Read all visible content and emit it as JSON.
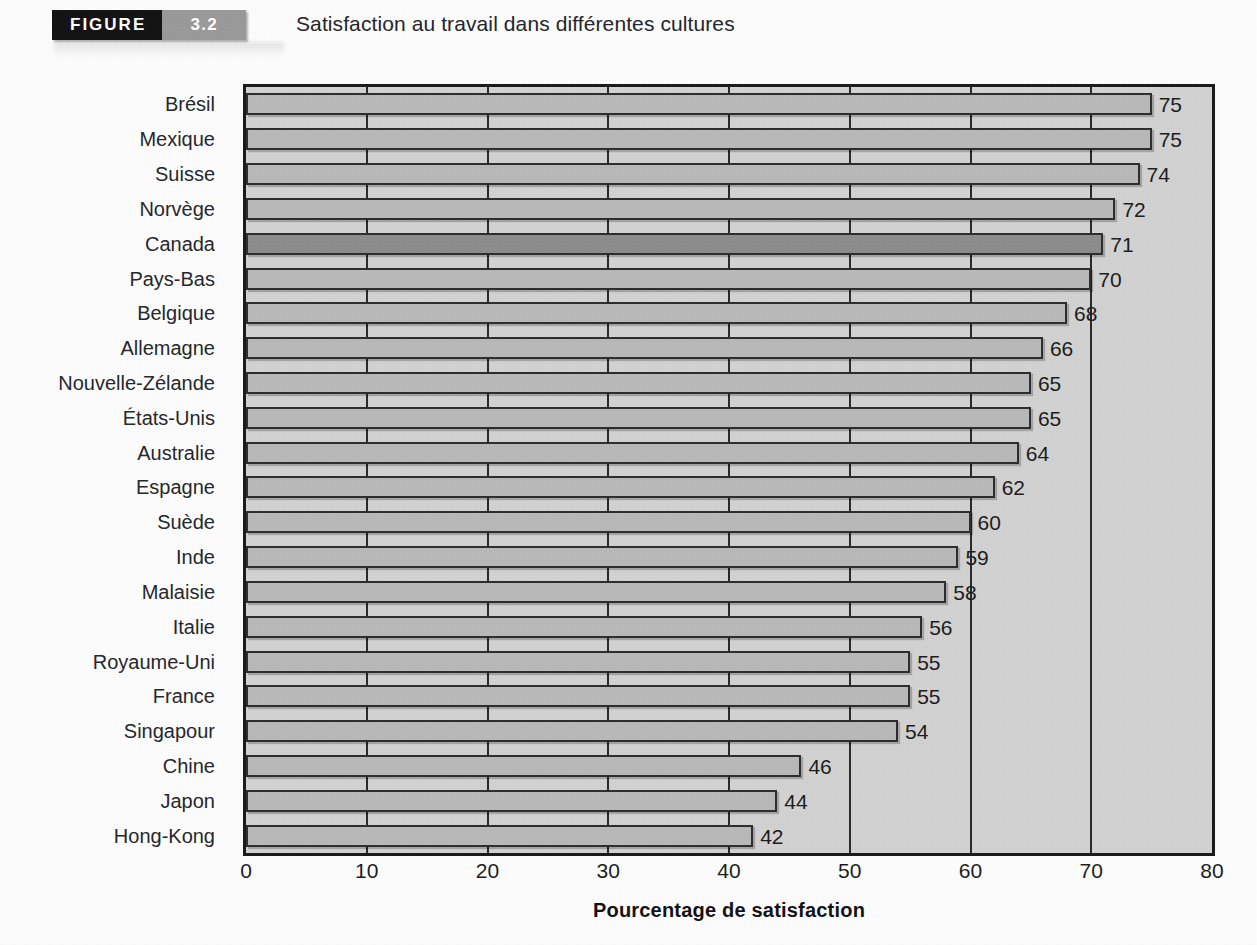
{
  "header": {
    "figure_word": "FIGURE",
    "figure_number": "3.2",
    "title": "Satisfaction au travail dans différentes cultures"
  },
  "chart_data": {
    "type": "bar",
    "orientation": "horizontal",
    "title": "Satisfaction au travail dans différentes cultures",
    "xlabel": "Pourcentage de satisfaction",
    "ylabel": "",
    "xlim": [
      0,
      80
    ],
    "xticks": [
      0,
      10,
      20,
      30,
      40,
      50,
      60,
      70,
      80
    ],
    "grid": true,
    "legend": "none",
    "highlight_category": "Canada",
    "categories": [
      "Brésil",
      "Mexique",
      "Suisse",
      "Norvège",
      "Canada",
      "Pays-Bas",
      "Belgique",
      "Allemagne",
      "Nouvelle-Zélande",
      "États-Unis",
      "Australie",
      "Espagne",
      "Suède",
      "Inde",
      "Malaisie",
      "Italie",
      "Royaume-Uni",
      "France",
      "Singapour",
      "Chine",
      "Japon",
      "Hong-Kong"
    ],
    "values": [
      75,
      75,
      74,
      72,
      71,
      70,
      68,
      66,
      65,
      65,
      64,
      62,
      60,
      59,
      58,
      56,
      55,
      55,
      54,
      46,
      44,
      42
    ],
    "value_labels": [
      "75",
      "75",
      "74",
      "72",
      "71",
      "70",
      "68",
      "66",
      "65",
      "65",
      "64",
      "62",
      "60",
      "59",
      "58",
      "56",
      "55",
      "55",
      "54",
      "46",
      "44",
      "42"
    ]
  },
  "colors": {
    "bar_fill": "#b9b9b9",
    "bar_highlight_fill": "#8d8d8d",
    "bar_border": "#2e2e2e",
    "plot_background": "#d2d2d2",
    "axis": "#1b1b1b",
    "figure_word_background": "#141414",
    "figure_number_background": "#9a9a9a"
  }
}
